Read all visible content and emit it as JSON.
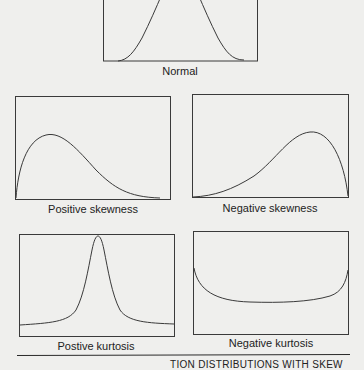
{
  "panels": [
    {
      "id": "normal",
      "label": "Normal"
    },
    {
      "id": "positive-skewness",
      "label": "Positive skewness"
    },
    {
      "id": "negative-skewness",
      "label": "Negative skewness"
    },
    {
      "id": "positive-kurtosis",
      "label": "Postive kurtosis"
    },
    {
      "id": "negative-kurtosis",
      "label": "Negative kurtosis"
    }
  ],
  "caption": "TION DISTRIBUTIONS WITH SKEW",
  "colors": {
    "background": "#efefed",
    "line": "#3a3a3a"
  }
}
